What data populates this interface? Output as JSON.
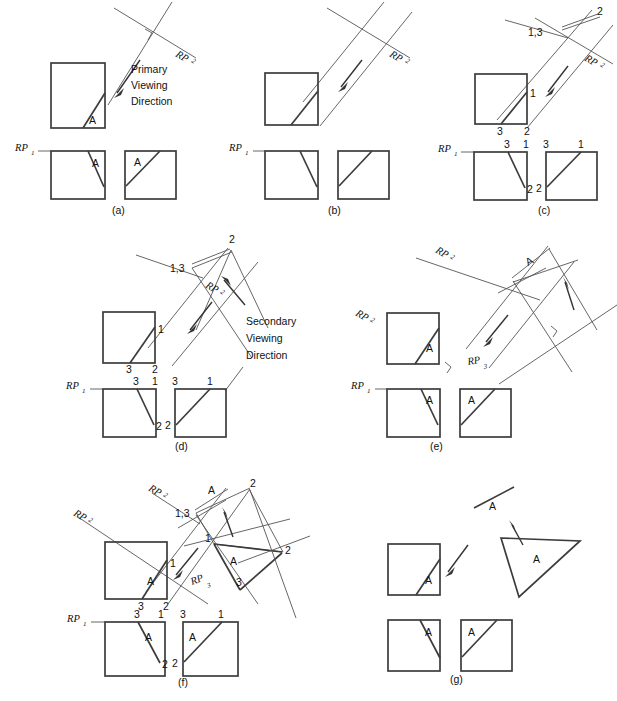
{
  "figure": {
    "stroke_color": "#3c3c3c",
    "thin_color": "#555555",
    "background": "#ffffff",
    "width": 617,
    "height": 701
  },
  "annotations": {
    "primary_viewing_direction": [
      "Primary",
      "Viewing",
      "Direction"
    ],
    "secondary_viewing_direction": [
      "Secondary",
      "Viewing",
      "Direction"
    ],
    "surface_label": "A",
    "reference_plane_1": "RP",
    "reference_plane_1_sub": "1",
    "reference_plane_2": "RP",
    "reference_plane_2_sub": "2",
    "reference_plane_3": "RP",
    "reference_plane_3_sub": "3",
    "vertex_1": "1",
    "vertex_2": "2",
    "vertex_3": "3",
    "vertex_13": "1,3"
  },
  "panels": [
    {
      "id": "a",
      "caption": "(a)",
      "caption_x": 112,
      "caption_y": 214,
      "labels": {
        "rp1": "RP",
        "rp1_sub": "1",
        "rp2": "RP",
        "rp2_sub": "2",
        "surface": "A",
        "note_lines": [
          "Primary",
          "Viewing",
          "Direction"
        ]
      }
    },
    {
      "id": "b",
      "caption": "(b)",
      "caption_x": 328,
      "caption_y": 214,
      "labels": {
        "rp1": "RP",
        "rp1_sub": "1",
        "rp2": "RP",
        "rp2_sub": "2"
      }
    },
    {
      "id": "c",
      "caption": "(c)",
      "caption_x": 538,
      "caption_y": 214,
      "labels": {
        "rp1": "RP",
        "rp1_sub": "1",
        "rp2": "RP",
        "rp2_sub": "2",
        "v1": "1",
        "v2": "2",
        "v3": "3",
        "v13": "1,3"
      }
    },
    {
      "id": "d",
      "caption": "(d)",
      "caption_x": 175,
      "caption_y": 450,
      "labels": {
        "rp1": "RP",
        "rp1_sub": "1",
        "rp2": "RP",
        "rp2_sub": "2",
        "v1": "1",
        "v2": "2",
        "v3": "3",
        "v13": "1,3",
        "note_lines": [
          "Secondary",
          "Viewing",
          "Direction"
        ]
      }
    },
    {
      "id": "e",
      "caption": "(e)",
      "caption_x": 430,
      "caption_y": 450,
      "labels": {
        "rp1": "RP",
        "rp1_sub": "1",
        "rp2": "RP",
        "rp2_sub": "2",
        "rp3": "RP",
        "rp3_sub": "3",
        "surface": "A"
      }
    },
    {
      "id": "f",
      "caption": "(f)",
      "caption_x": 178,
      "caption_y": 686,
      "labels": {
        "rp1": "RP",
        "rp1_sub": "1",
        "rp2": "RP",
        "rp2_sub": "2",
        "rp3": "RP",
        "rp3_sub": "3",
        "surface": "A",
        "v1": "1",
        "v2": "2",
        "v3": "3",
        "v13": "1,3"
      }
    },
    {
      "id": "g",
      "caption": "(g)",
      "caption_x": 450,
      "caption_y": 683,
      "labels": {
        "surface": "A"
      }
    }
  ]
}
